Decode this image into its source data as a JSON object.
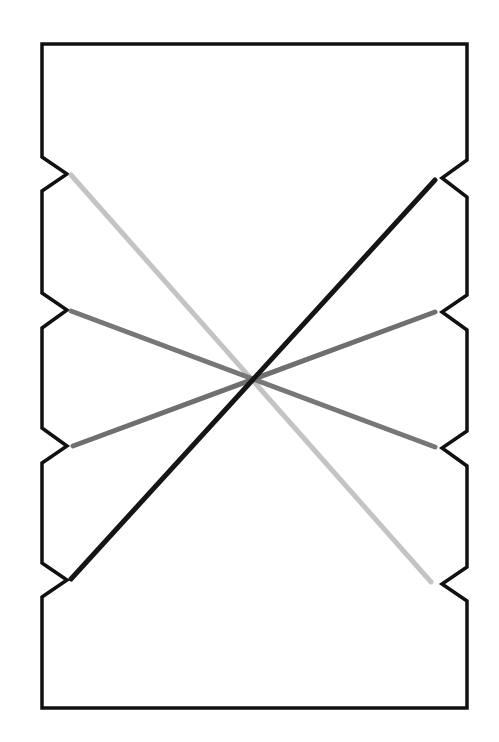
{
  "diagram": {
    "background": "#ffffff",
    "outline": {
      "color": "#111111",
      "stroke_width": 3.5,
      "top": 44,
      "bottom": 708,
      "left": 42,
      "right": 467,
      "notch_depth": 25,
      "left_notches": [
        {
          "start": 157,
          "tip": 174,
          "end": 191
        },
        {
          "start": 293,
          "tip": 310,
          "end": 328
        },
        {
          "start": 428,
          "tip": 446,
          "end": 463
        },
        {
          "start": 563,
          "tip": 580,
          "end": 597
        }
      ],
      "right_notches": [
        {
          "start": 160,
          "tip": 178,
          "end": 197
        },
        {
          "start": 295,
          "tip": 312,
          "end": 330
        },
        {
          "start": 431,
          "tip": 448,
          "end": 466
        },
        {
          "start": 567,
          "tip": 584,
          "end": 601
        }
      ]
    },
    "lines": [
      {
        "name": "light-gray-line",
        "color": "#c4c4c4",
        "x1": 71,
        "y1": 175,
        "x2": 431,
        "y2": 582,
        "width": 5
      },
      {
        "name": "mid-gray-line-a",
        "color": "#777777",
        "x1": 71,
        "y1": 311,
        "x2": 435,
        "y2": 447,
        "width": 5
      },
      {
        "name": "mid-gray-line-b",
        "color": "#6f6f6f",
        "x1": 73,
        "y1": 446,
        "x2": 435,
        "y2": 312,
        "width": 5
      },
      {
        "name": "black-line",
        "color": "#151515",
        "x1": 71,
        "y1": 579,
        "x2": 435,
        "y2": 180,
        "width": 5
      }
    ]
  }
}
